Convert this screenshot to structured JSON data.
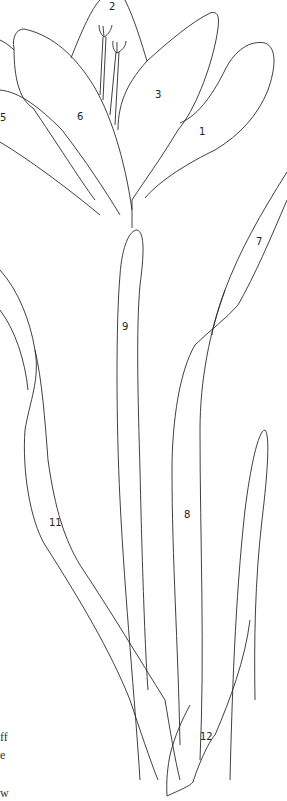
{
  "illustration": {
    "subject": "lily flower coloring page",
    "labels": [
      "1",
      "2",
      "3",
      "5",
      "6",
      "7",
      "8",
      "9",
      "11",
      "12"
    ],
    "line_color": "#2a2a2a",
    "background": "#ffffff"
  },
  "caption_fragments": [
    "ff",
    "e",
    "w"
  ]
}
